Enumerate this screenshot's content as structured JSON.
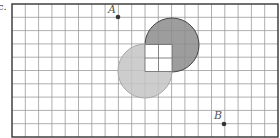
{
  "figure": {
    "corner_label": "c.",
    "grid": {
      "x0": 12,
      "y0": 4,
      "cell": 13.3,
      "cols": 20,
      "rows": 10,
      "line_color": "#9a9a9a",
      "border_color": "#333333"
    },
    "circles": [
      {
        "name": "dark-circle",
        "cx": 172,
        "cy": 45,
        "r": 27,
        "fill": "#8c8c8c",
        "stroke": "#444444"
      },
      {
        "name": "light-circle",
        "cx": 145,
        "cy": 71,
        "r": 27,
        "fill": "#c4c4c4",
        "stroke": "#a8a8a8"
      }
    ],
    "overlap_square": {
      "x": 145,
      "y": 44.5,
      "size": 27,
      "fill": "#ffffff"
    },
    "points": [
      {
        "label": "A",
        "x": 118,
        "y": 17,
        "label_x": 108,
        "label_y": 13
      },
      {
        "label": "B",
        "x": 224,
        "y": 124,
        "label_x": 214,
        "label_y": 119
      }
    ]
  }
}
